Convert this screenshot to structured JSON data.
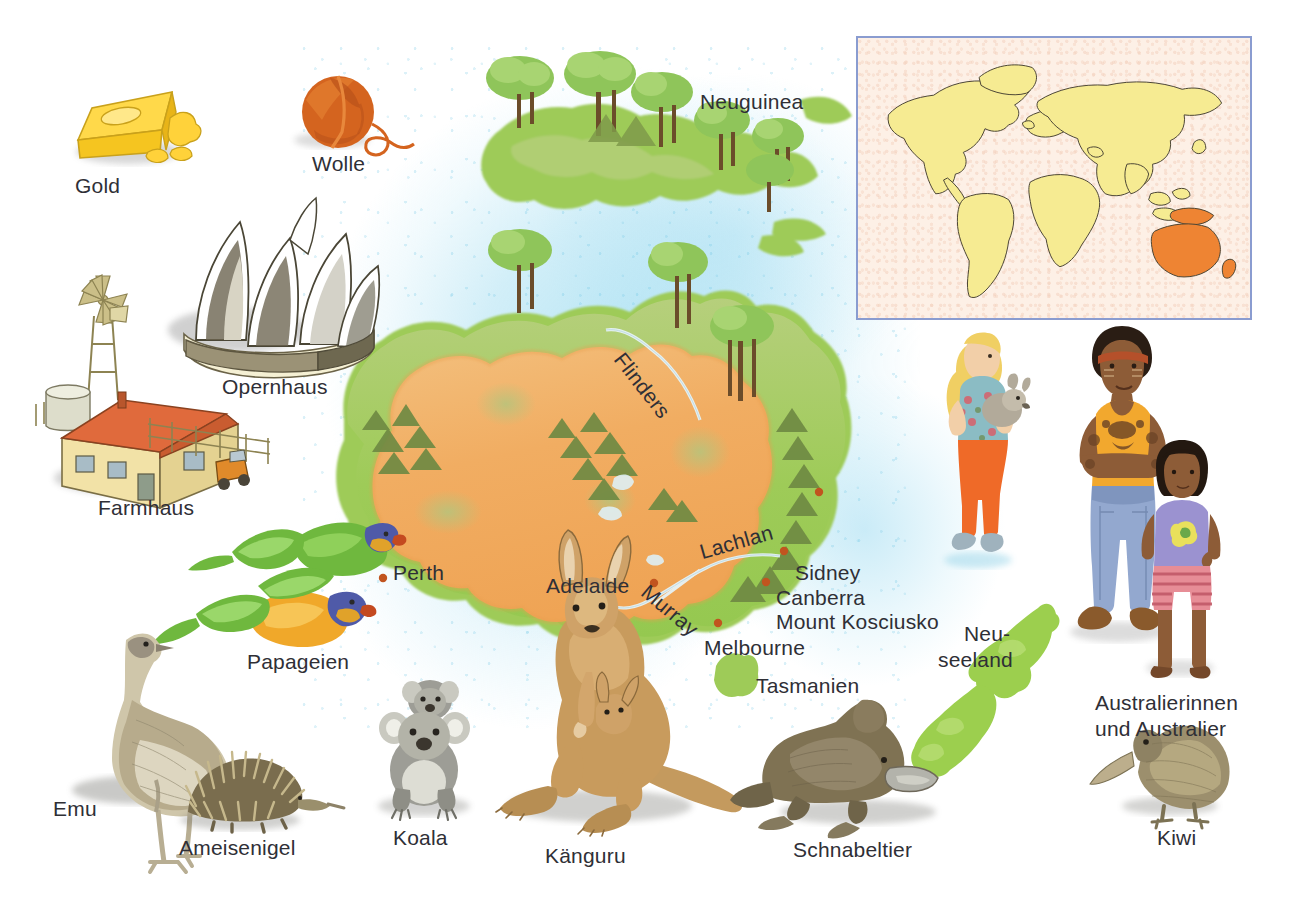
{
  "page": {
    "language": "de",
    "background_color": "#ffffff"
  },
  "colors": {
    "ocean": "#9edcf0",
    "desert_interior": "#f0ad63",
    "coastal_green": "#9ccf5a",
    "inland_green": "#b9cc78",
    "mountain": "#6d6a3c",
    "city_dot": "#c1541f",
    "label_text": "#2f2f36",
    "inset_border": "#8a9cd0",
    "inset_background": "#fdf0e6",
    "inset_land": "#f6eb92",
    "inset_highlight": "#ee8433"
  },
  "world_inset": {
    "name": "world-map-inset",
    "land_color": "#f6eb92",
    "highlight_color": "#ee8433",
    "highlighted_regions": [
      "Australien",
      "Neuguinea",
      "Neuseeland"
    ]
  },
  "map_labels": {
    "regions": [
      {
        "id": "neuguinea",
        "text": "Neuguinea",
        "x": 700,
        "y": 90
      },
      {
        "id": "tasmanien",
        "text": "Tasmanien",
        "x": 756,
        "y": 674
      },
      {
        "id": "neuseeland_line1",
        "text": "Neu-",
        "x": 964,
        "y": 622
      },
      {
        "id": "neuseeland_line2",
        "text": "seeland",
        "x": 938,
        "y": 648
      }
    ],
    "cities": [
      {
        "id": "perth",
        "text": "Perth",
        "x": 393,
        "y": 561
      },
      {
        "id": "adelaide",
        "text": "Adelaide",
        "x": 546,
        "y": 574
      },
      {
        "id": "sidney",
        "text": "Sidney",
        "x": 795,
        "y": 561
      },
      {
        "id": "canberra",
        "text": "Canberra",
        "x": 776,
        "y": 586
      },
      {
        "id": "melbourne",
        "text": "Melbourne",
        "x": 704,
        "y": 636
      }
    ],
    "mountains": [
      {
        "id": "mount-kosciusko",
        "text": "Mount Kosciusko",
        "x": 776,
        "y": 610
      }
    ],
    "rivers": [
      {
        "id": "flinders",
        "text": "Flinders",
        "x": 628,
        "y": 348,
        "rotation": 52
      },
      {
        "id": "lachlan",
        "text": "Lachlan",
        "x": 697,
        "y": 541,
        "rotation": -16
      },
      {
        "id": "murray",
        "text": "Murray",
        "x": 652,
        "y": 580,
        "rotation": 40
      }
    ]
  },
  "illustrations": [
    {
      "id": "gold",
      "label": "Gold",
      "label_x": 75,
      "label_y": 174,
      "icon": "gold-bar-icon"
    },
    {
      "id": "wolle",
      "label": "Wolle",
      "label_x": 312,
      "label_y": 152,
      "icon": "wool-ball-icon"
    },
    {
      "id": "opernhaus",
      "label": "Opernhaus",
      "label_x": 222,
      "label_y": 375,
      "icon": "opera-house-icon"
    },
    {
      "id": "farmhaus",
      "label": "Farmhaus",
      "label_x": 98,
      "label_y": 496,
      "icon": "farm-house-icon"
    },
    {
      "id": "papageien",
      "label": "Papageien",
      "label_x": 247,
      "label_y": 650,
      "icon": "parrot-icon"
    },
    {
      "id": "emu",
      "label": "Emu",
      "label_x": 53,
      "label_y": 797,
      "icon": "emu-icon"
    },
    {
      "id": "ameisenigel",
      "label": "Ameisenigel",
      "label_x": 179,
      "label_y": 836,
      "icon": "echidna-icon"
    },
    {
      "id": "koala",
      "label": "Koala",
      "label_x": 393,
      "label_y": 826,
      "icon": "koala-icon"
    },
    {
      "id": "kaenguru",
      "label": "Känguru",
      "label_x": 545,
      "label_y": 844,
      "icon": "kangaroo-icon"
    },
    {
      "id": "schnabeltier",
      "label": "Schnabeltier",
      "label_x": 793,
      "label_y": 838,
      "icon": "platypus-icon"
    },
    {
      "id": "kiwi",
      "label": "Kiwi",
      "label_x": 1157,
      "label_y": 826,
      "icon": "kiwi-bird-icon"
    },
    {
      "id": "australier_l1",
      "label": "Australierinnen",
      "label_x": 1095,
      "label_y": 691,
      "icon": "people-icon"
    },
    {
      "id": "australier_l2",
      "label": "und Australier",
      "label_x": 1095,
      "label_y": 717,
      "icon": "people-icon"
    }
  ],
  "people": [
    {
      "id": "girl-with-wombat",
      "description": "Mädchen mit Tier"
    },
    {
      "id": "aboriginal-man",
      "description": "Mann"
    },
    {
      "id": "aboriginal-girl",
      "description": "Mädchen"
    }
  ]
}
